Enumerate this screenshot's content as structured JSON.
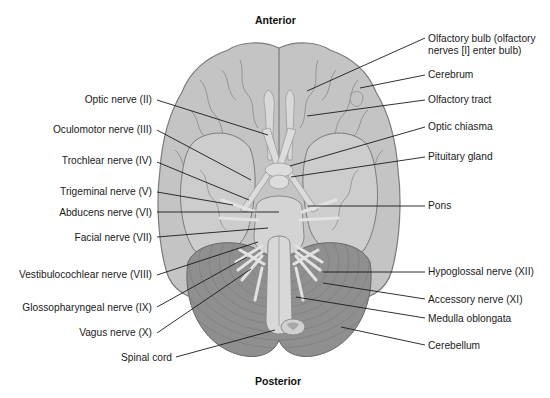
{
  "figure": {
    "title_top": "Anterior",
    "title_bottom": "Posterior",
    "colors": {
      "cerebrum": "#c4c4c4",
      "cerebrum_outline": "#7a7a7a",
      "sulci": "#8e8e8e",
      "temporal_lobe": "#cdcdcd",
      "brainstem": "#d6d6d6",
      "nerves": "#e2e2e2",
      "cerebellum": "#8f8f8f",
      "cerebellum_folia": "#7c7c7c",
      "leader_line": "#1a1a1a"
    }
  },
  "labels_left": [
    {
      "text": "Optic nerve (II)"
    },
    {
      "text": "Oculomotor nerve (III)"
    },
    {
      "text": "Trochlear nerve (IV)"
    },
    {
      "text": "Trigeminal nerve (V)"
    },
    {
      "text": "Abducens nerve (VI)"
    },
    {
      "text": "Facial nerve (VII)"
    },
    {
      "text": "Vestibulocochlear nerve (VIII)"
    },
    {
      "text": "Glossopharyngeal nerve (IX)"
    },
    {
      "text": "Vagus nerve (X)"
    },
    {
      "text": "Spinal cord"
    }
  ],
  "labels_right": [
    {
      "text": "Olfactory bulb (olfactory",
      "text2": "nerves [I] enter bulb)"
    },
    {
      "text": "Cerebrum"
    },
    {
      "text": "Olfactory tract"
    },
    {
      "text": "Optic chiasma"
    },
    {
      "text": "Pituitary gland"
    },
    {
      "text": "Pons"
    },
    {
      "text": "Hypoglossal nerve (XII)"
    },
    {
      "text": "Accessory nerve (XI)"
    },
    {
      "text": "Medulla oblongata"
    },
    {
      "text": "Cerebellum"
    }
  ]
}
